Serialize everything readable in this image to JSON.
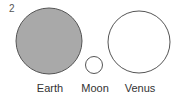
{
  "figure": {
    "number": "2",
    "bodies": [
      {
        "name": "Earth",
        "cx": 49,
        "cy": 41,
        "r": 33,
        "fill": "#a9a9a9",
        "stroke": "#555555",
        "label_x": 50
      },
      {
        "name": "Moon",
        "cx": 94,
        "cy": 65,
        "r": 8.5,
        "fill": "#ffffff",
        "stroke": "#555555",
        "label_x": 95
      },
      {
        "name": "Venus",
        "cx": 139,
        "cy": 42,
        "r": 31,
        "fill": "#ffffff",
        "stroke": "#555555",
        "label_x": 140
      }
    ]
  }
}
